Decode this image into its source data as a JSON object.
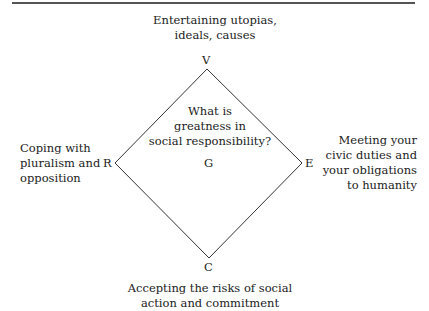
{
  "diagram": {
    "center_question": "What is\ngreatness in\nsocial responsibility?",
    "center_letter": "G",
    "vertices": {
      "top": {
        "letter": "V",
        "label": "Entertaining utopias,\nideals, causes"
      },
      "right": {
        "letter": "E",
        "label": "Meeting your\ncivic duties and\nyour obligations\nto humanity"
      },
      "bottom": {
        "letter": "C",
        "label": "Accepting the risks of social\naction and commitment"
      },
      "left": {
        "letter": "R",
        "label": "Coping with\npluralism and\nopposition"
      }
    },
    "colors": {
      "line": "#333333",
      "text": "#222222",
      "rule": "#555555"
    }
  }
}
